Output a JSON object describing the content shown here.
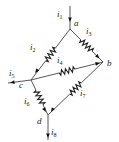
{
  "diagram": {
    "type": "resistor-network",
    "nodes": [
      {
        "id": "a",
        "label": "a"
      },
      {
        "id": "b",
        "label": "b"
      },
      {
        "id": "c",
        "label": "c"
      },
      {
        "id": "d",
        "label": "d"
      }
    ],
    "branches": [
      {
        "id": "i2",
        "from": "a",
        "to": "c",
        "element": "resistor",
        "current": {
          "sym": "i",
          "sub": "2"
        }
      },
      {
        "id": "i3",
        "from": "a",
        "to": "b",
        "element": "resistor",
        "current": {
          "sym": "i",
          "sub": "3"
        }
      },
      {
        "id": "i4",
        "from": "b",
        "to": "c",
        "element": "resistor",
        "current": {
          "sym": "i",
          "sub": "4"
        }
      },
      {
        "id": "i6",
        "from": "c",
        "to": "d",
        "element": "resistor",
        "current": {
          "sym": "i",
          "sub": "6"
        }
      },
      {
        "id": "i7",
        "from": "d",
        "to": "b",
        "element": "resistor",
        "current": {
          "sym": "i",
          "sub": "7"
        }
      }
    ],
    "terminals": [
      {
        "id": "i1",
        "node": "a",
        "direction": "in",
        "current": {
          "sym": "i",
          "sub": "1"
        }
      },
      {
        "id": "i5",
        "node": "c",
        "direction": "out",
        "current": {
          "sym": "i",
          "sub": "5"
        }
      },
      {
        "id": "i8",
        "node": "d",
        "direction": "out",
        "current": {
          "sym": "i",
          "sub": "8"
        }
      }
    ]
  }
}
